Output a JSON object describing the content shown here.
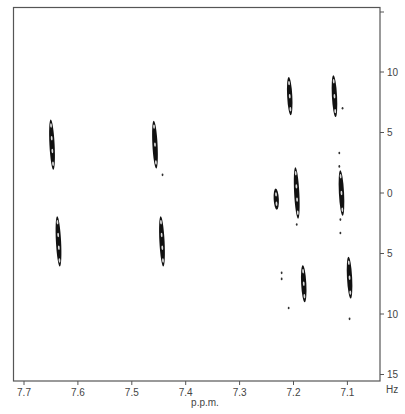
{
  "chart_data": {
    "type": "scatter",
    "subtype": "2D NMR contour plot (J-resolved)",
    "title": "",
    "xlabel": "p.p.m.",
    "ylabel": "Hz",
    "xlim": [
      7.73,
      7.05
    ],
    "ylim": [
      -15,
      15
    ],
    "x_ticks": [
      7.7,
      7.6,
      7.5,
      7.4,
      7.3,
      7.2,
      7.1
    ],
    "x_tick_labels": [
      "7.7",
      "7.6",
      "7.5",
      "7.4",
      "7.3",
      "7.2",
      "7.1"
    ],
    "y_ticks": [
      -15,
      -10,
      -5,
      0,
      5,
      10,
      15
    ],
    "y_tick_labels": [
      "",
      "10",
      "5",
      "0",
      "5",
      "10",
      "15"
    ],
    "y_axis_position": "right",
    "grid": false,
    "legend": null,
    "peaks": [
      {
        "ppm": 7.648,
        "hz_center": -4.0,
        "hz_span": 3.5,
        "label": "multiplet-A-upper"
      },
      {
        "ppm": 7.636,
        "hz_center": 4.0,
        "hz_span": 3.5,
        "label": "multiplet-A-lower"
      },
      {
        "ppm": 7.457,
        "hz_center": -4.0,
        "hz_span": 3.3,
        "label": "multiplet-B-upper"
      },
      {
        "ppm": 7.444,
        "hz_center": 4.0,
        "hz_span": 3.5,
        "label": "multiplet-B-lower"
      },
      {
        "ppm": 7.207,
        "hz_center": -8.0,
        "hz_span": 2.5,
        "label": "multiplet-C-top"
      },
      {
        "ppm": 7.232,
        "hz_center": 0.5,
        "hz_span": 1.1,
        "label": "small-peak"
      },
      {
        "ppm": 7.194,
        "hz_center": 0.0,
        "hz_span": 3.6,
        "label": "multiplet-C-middle"
      },
      {
        "ppm": 7.181,
        "hz_center": 7.5,
        "hz_span": 2.4,
        "label": "multiplet-C-bottom"
      },
      {
        "ppm": 7.124,
        "hz_center": -8.0,
        "hz_span": 2.8,
        "label": "multiplet-D-top"
      },
      {
        "ppm": 7.111,
        "hz_center": 0.0,
        "hz_span": 3.1,
        "label": "multiplet-D-middle"
      },
      {
        "ppm": 7.096,
        "hz_center": 7.0,
        "hz_span": 2.8,
        "label": "multiplet-D-bottom"
      }
    ],
    "minor_dots": [
      {
        "ppm": 7.443,
        "hz": -1.5
      },
      {
        "ppm": 7.109,
        "hz": -7.0
      },
      {
        "ppm": 7.115,
        "hz": -3.3
      },
      {
        "ppm": 7.115,
        "hz": -2.2
      },
      {
        "ppm": 7.194,
        "hz": 2.6
      },
      {
        "ppm": 7.113,
        "hz": 2.2
      },
      {
        "ppm": 7.113,
        "hz": 3.3
      },
      {
        "ppm": 7.222,
        "hz": 6.6
      },
      {
        "ppm": 7.222,
        "hz": 7.1
      },
      {
        "ppm": 7.209,
        "hz": 9.5
      },
      {
        "ppm": 7.096,
        "hz": 10.4
      }
    ]
  },
  "axes": {
    "x_title": "p.p.m.",
    "y_unit": "Hz"
  }
}
